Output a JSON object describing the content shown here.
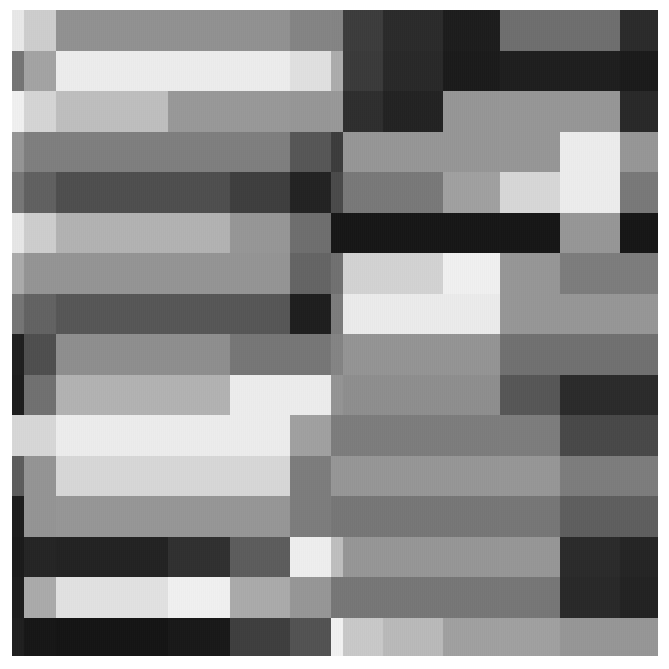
{
  "chart_data": {
    "type": "heatmap",
    "title": "",
    "subtitle": "",
    "xlabel": "",
    "ylabel": "",
    "grid": false,
    "legend": "none",
    "colormap": "gray",
    "value_range": [
      0,
      255
    ],
    "plot_area": {
      "x": 12,
      "y": 10,
      "width": 646,
      "height": 646
    },
    "background": "#ffffff",
    "annotations": [],
    "x_tick_labels": [],
    "y_tick_labels": [],
    "col_edges": [
      0,
      12,
      44,
      100,
      156,
      218,
      278,
      319,
      331,
      371,
      431,
      488,
      548,
      608,
      646
    ],
    "row_edges": [
      0,
      41,
      81,
      122,
      162,
      203,
      243,
      284,
      324,
      365,
      405,
      446,
      486,
      527,
      567,
      608,
      646
    ],
    "columns": [
      "c1",
      "c2",
      "c3",
      "c4",
      "c5",
      "c6",
      "c7",
      "c8",
      "c9",
      "c10",
      "c11",
      "c12",
      "c13",
      "c14"
    ],
    "rows": [
      "r1",
      "r2",
      "r3",
      "r4",
      "r5",
      "r6",
      "r7",
      "r8",
      "r9",
      "r10",
      "r11",
      "r12",
      "r13",
      "r14",
      "r15",
      "r16"
    ],
    "values": [
      [
        232,
        205,
        145,
        145,
        145,
        145,
        132,
        132,
        60,
        42,
        28,
        110,
        110,
        42
      ],
      [
        116,
        163,
        236,
        236,
        236,
        236,
        224,
        172,
        58,
        40,
        26,
        30,
        30,
        26
      ],
      [
        240,
        213,
        190,
        190,
        152,
        152,
        150,
        152,
        46,
        34,
        150,
        150,
        150,
        40
      ],
      [
        148,
        126,
        126,
        126,
        126,
        126,
        86,
        60,
        150,
        150,
        150,
        150,
        236,
        150
      ],
      [
        118,
        96,
        78,
        78,
        78,
        62,
        34,
        74,
        120,
        120,
        160,
        215,
        236,
        120
      ],
      [
        230,
        205,
        178,
        178,
        178,
        150,
        110,
        22,
        22,
        22,
        22,
        22,
        150,
        22
      ],
      [
        170,
        148,
        148,
        148,
        148,
        148,
        100,
        112,
        210,
        210,
        240,
        150,
        124,
        124
      ],
      [
        116,
        98,
        86,
        86,
        86,
        86,
        30,
        124,
        235,
        235,
        235,
        150,
        150,
        150
      ],
      [
        30,
        78,
        142,
        142,
        142,
        118,
        118,
        132,
        148,
        148,
        148,
        112,
        112,
        112
      ],
      [
        28,
        112,
        178,
        178,
        178,
        236,
        236,
        148,
        142,
        142,
        142,
        86,
        42,
        42
      ],
      [
        215,
        215,
        236,
        236,
        236,
        236,
        160,
        124,
        124,
        124,
        124,
        124,
        72,
        72
      ],
      [
        92,
        148,
        215,
        215,
        215,
        215,
        124,
        150,
        150,
        150,
        150,
        150,
        124,
        124
      ],
      [
        28,
        148,
        150,
        150,
        150,
        150,
        124,
        118,
        118,
        118,
        118,
        118,
        94,
        94
      ],
      [
        26,
        36,
        34,
        34,
        48,
        92,
        238,
        190,
        150,
        150,
        150,
        150,
        42,
        36
      ],
      [
        28,
        170,
        225,
        225,
        240,
        170,
        150,
        118,
        118,
        118,
        118,
        118,
        40,
        34
      ],
      [
        30,
        22,
        20,
        20,
        24,
        62,
        82,
        242,
        200,
        185,
        160,
        160,
        150,
        150
      ]
    ]
  }
}
